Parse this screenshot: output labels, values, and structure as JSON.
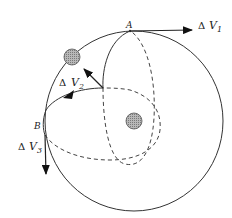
{
  "diagram": {
    "points": {
      "A": "A",
      "B": "B"
    },
    "impulses": [
      {
        "delta": "Δ",
        "symbol": "V",
        "subscript": "1"
      },
      {
        "delta": "Δ",
        "symbol": "V",
        "subscript": "2"
      },
      {
        "delta": "Δ",
        "symbol": "V",
        "subscript": "3"
      }
    ],
    "colors": {
      "line": "#333333",
      "body_fill": "#aaaaaa",
      "background": "#ffffff"
    }
  }
}
